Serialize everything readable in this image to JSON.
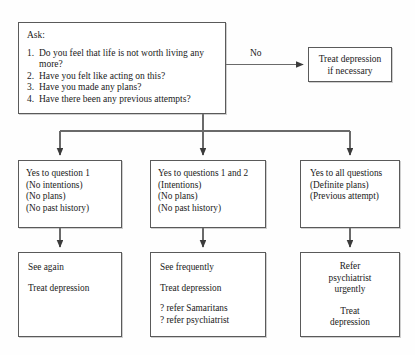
{
  "diagram": {
    "line_color": "#5a5a5a",
    "background_color": "#fefefe"
  },
  "ask_node": {
    "title": "Ask:",
    "questions": [
      {
        "num": "1.",
        "text": "Do you feel that life is not worth living any more?"
      },
      {
        "num": "2.",
        "text": "Have you felt like acting on this?"
      },
      {
        "num": "3.",
        "text": "Have you made any plans?"
      },
      {
        "num": "4.",
        "text": "Have there been any previous attempts?"
      }
    ]
  },
  "edges": {
    "no_label": "No"
  },
  "no_outcome": {
    "text": "Treat depression\nif necessary"
  },
  "criteria": [
    {
      "id": "crit-1",
      "lines": "Yes to question 1\n(No intentions)\n(No plans)\n(No past history)"
    },
    {
      "id": "crit-2",
      "lines": "Yes to questions 1 and 2\n(Intentions)\n(No plans)\n(No past history)"
    },
    {
      "id": "crit-3",
      "lines": "Yes to all questions\n(Definite plans)\n(Previous attempt)"
    }
  ],
  "actions": [
    {
      "id": "act-1",
      "para1": "See again",
      "para2": "Treat depression",
      "para3": ""
    },
    {
      "id": "act-2",
      "para1": "See frequently",
      "para2": "Treat depression",
      "para3": "? refer Samaritans\n? refer psychiatrist"
    },
    {
      "id": "act-3",
      "para1": "Refer\npsychiatrist\nurgently",
      "para2": "Treat\ndepression",
      "para3": ""
    }
  ]
}
